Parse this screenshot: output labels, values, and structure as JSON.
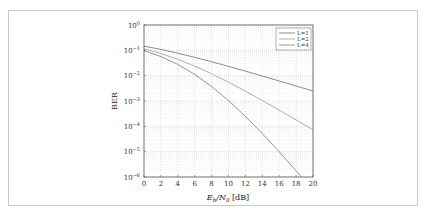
{
  "chart_data": {
    "type": "line",
    "title": "",
    "xlabel": "E_b/N_0 [dB]",
    "ylabel": "BER",
    "xlim": [
      0,
      20
    ],
    "ylim": [
      1e-06,
      1
    ],
    "yscale": "log",
    "grid": true,
    "legend_position": "upper right",
    "x_ticks": [
      0,
      2,
      4,
      6,
      8,
      10,
      12,
      14,
      16,
      18,
      20
    ],
    "y_ticks": [
      "10^0",
      "10^-1",
      "10^-2",
      "10^-3",
      "10^-4",
      "10^-5",
      "10^-6"
    ],
    "x": [
      0,
      2,
      4,
      6,
      8,
      10,
      12,
      14,
      16,
      18,
      20
    ],
    "series": [
      {
        "name": "L=1",
        "color": "#6e6e6e",
        "values": [
          0.146,
          0.109,
          0.0771,
          0.053,
          0.0355,
          0.0233,
          0.0151,
          0.00967,
          0.00617,
          0.00391,
          0.00248
        ]
      },
      {
        "name": "L=2",
        "color": "#9a9a9a",
        "values": [
          0.115,
          0.0748,
          0.0442,
          0.0239,
          0.0119,
          0.00554,
          0.00245,
          0.00105,
          0.000437,
          0.000179,
          7.3e-05
        ]
      },
      {
        "name": "L=4",
        "color": "#7a7a7a",
        "values": [
          0.0975,
          0.0565,
          0.0277,
          0.0112,
          0.00374,
          0.00104,
          0.000247,
          5.16e-05,
          9.9e-06,
          1.76e-06,
          3.04e-07
        ]
      }
    ]
  },
  "labels": {
    "xlabel_main": "E",
    "xlabel_sub1": "b",
    "xlabel_mid": "/N",
    "xlabel_sub2": "0",
    "xlabel_unit": " [dB]",
    "ylabel": "BER"
  }
}
